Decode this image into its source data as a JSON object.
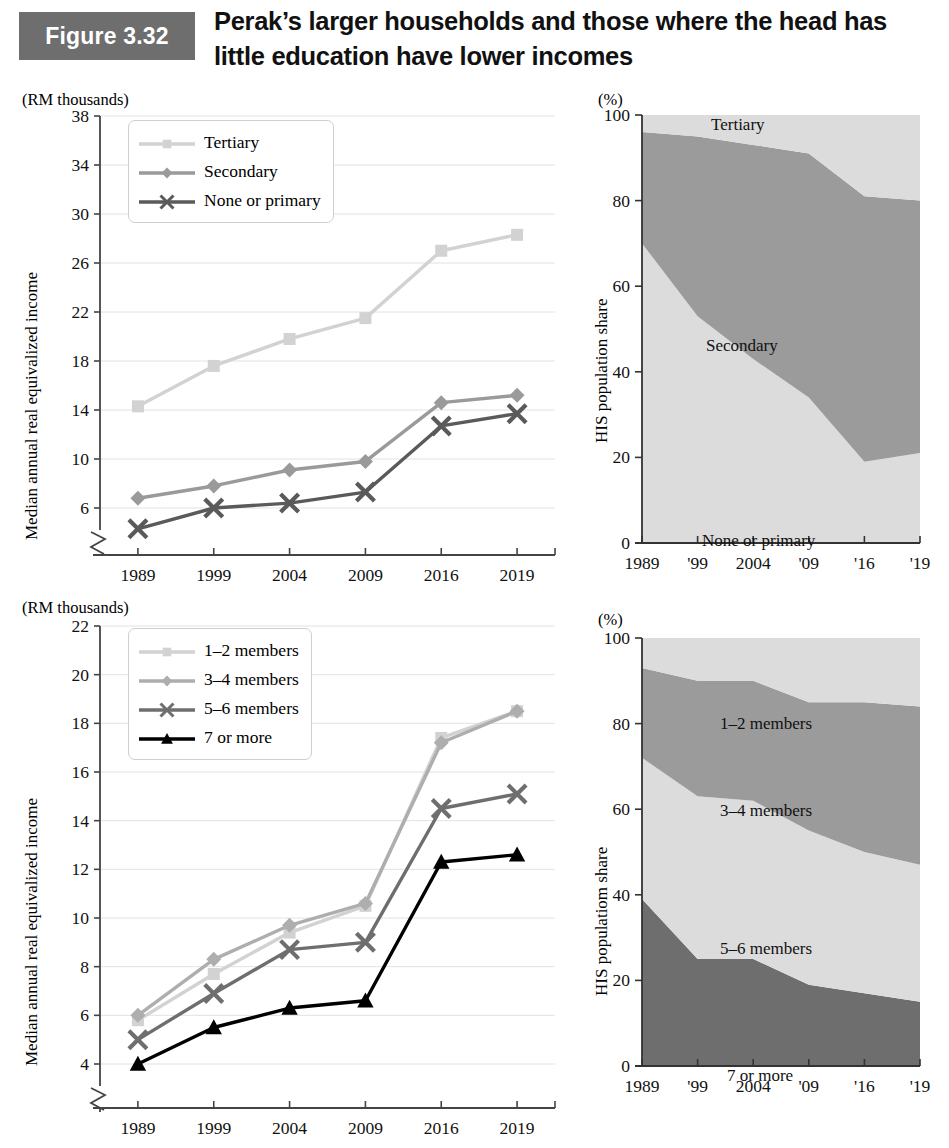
{
  "header": {
    "figure_badge": "Figure 3.32",
    "title_line1": "Perak’s larger households and those where the head has",
    "title_line2": "little education have lower incomes",
    "badge_color": "#6e6e6e"
  },
  "colors": {
    "tertiary": "#d2d2d2",
    "secondary": "#9a9a9a",
    "none_or_primary": "#5a5a5a",
    "m12": "#d2d2d2",
    "m34": "#aeaeae",
    "m56": "#6e6e6e",
    "m7plus": "#000000",
    "area_light": "#dcdcdc",
    "area_mid": "#9b9b9b",
    "area_dark": "#6e6e6e",
    "gridline": "#e2e2e2",
    "axis": "#555555"
  },
  "panels": {
    "top_left": {
      "unit_label": "(RM thousands)",
      "y_axis_title": "Median annual real equivalized income",
      "legend": [
        "Tertiary",
        "Secondary",
        "None or primary"
      ]
    },
    "top_right": {
      "unit_label": "(%)",
      "y_axis_title": "HIS population share",
      "area_labels": [
        "Tertiary",
        "Secondary",
        "None or primary"
      ]
    },
    "bottom_left": {
      "unit_label": "(RM thousands)",
      "y_axis_title": "Median annual real equivalized income",
      "legend": [
        "1–2 members",
        "3–4 members",
        "5–6 members",
        "7 or more"
      ]
    },
    "bottom_right": {
      "unit_label": "(%)",
      "y_axis_title": "HIS populatiom share",
      "area_labels": [
        "1–2 members",
        "3–4 members",
        "5–6 members",
        "7 or more"
      ]
    }
  },
  "chart_data": [
    {
      "id": "top_left",
      "type": "line",
      "title": "Median real equivalized income by education of household head",
      "xlabel": "",
      "ylabel": "Median annual real equivalized income",
      "unit": "(RM thousands)",
      "categories": [
        "1989",
        "1999",
        "2004",
        "2009",
        "2016",
        "2019"
      ],
      "yticks": [
        6,
        10,
        14,
        18,
        22,
        26,
        30,
        34,
        38
      ],
      "ylim": [
        4.2,
        38
      ],
      "axis_break": true,
      "grid": true,
      "legend_position": "top-left-inside",
      "series": [
        {
          "name": "Tertiary",
          "marker": "square",
          "color": "#d2d2d2",
          "values": [
            14.3,
            17.6,
            19.8,
            21.5,
            27.0,
            28.3
          ]
        },
        {
          "name": "Secondary",
          "marker": "diamond",
          "color": "#9a9a9a",
          "values": [
            6.8,
            7.8,
            9.1,
            9.8,
            14.6,
            15.2
          ]
        },
        {
          "name": "None or primary",
          "marker": "cross",
          "color": "#5a5a5a",
          "values": [
            4.3,
            6.0,
            6.4,
            7.3,
            12.7,
            13.7
          ]
        }
      ]
    },
    {
      "id": "top_right",
      "type": "area",
      "title": "HIS population share by education of household head",
      "xlabel": "",
      "ylabel": "HIS population share",
      "unit": "(%)",
      "x": [
        "1989",
        "'99",
        "2004",
        "'09",
        "'16",
        "'19"
      ],
      "yticks": [
        0,
        20,
        40,
        60,
        80,
        100
      ],
      "ylim": [
        0,
        100
      ],
      "stacked": true,
      "grid": false,
      "series": [
        {
          "name": "None or primary",
          "color": "#dcdcdc",
          "values": [
            70,
            53,
            43,
            34,
            19,
            21
          ]
        },
        {
          "name": "Secondary",
          "color": "#9b9b9b",
          "values": [
            26,
            42,
            50,
            57,
            62,
            59
          ]
        },
        {
          "name": "Tertiary",
          "color": "#dcdcdc",
          "values": [
            4,
            5,
            7,
            9,
            19,
            20
          ]
        }
      ]
    },
    {
      "id": "bottom_left",
      "type": "line",
      "title": "Median real equivalized income by household size",
      "xlabel": "",
      "ylabel": "Median annual real equivalized income",
      "unit": "(RM thousands)",
      "categories": [
        "1989",
        "1999",
        "2004",
        "2009",
        "2016",
        "2019"
      ],
      "yticks": [
        4,
        6,
        8,
        10,
        12,
        14,
        16,
        18,
        20,
        22
      ],
      "ylim": [
        3.2,
        22
      ],
      "axis_break": true,
      "grid": true,
      "legend_position": "top-left-inside",
      "series": [
        {
          "name": "1–2 members",
          "marker": "square",
          "color": "#d2d2d2",
          "values": [
            5.8,
            7.7,
            9.4,
            10.5,
            17.4,
            18.5
          ]
        },
        {
          "name": "3–4 members",
          "marker": "diamond",
          "color": "#aeaeae",
          "values": [
            6.0,
            8.3,
            9.7,
            10.6,
            17.2,
            18.5
          ]
        },
        {
          "name": "5–6 members",
          "marker": "cross",
          "color": "#6e6e6e",
          "values": [
            5.0,
            6.9,
            8.7,
            9.0,
            14.5,
            15.1
          ]
        },
        {
          "name": "7 or more",
          "marker": "triangle",
          "color": "#000000",
          "values": [
            4.0,
            5.5,
            6.3,
            6.6,
            12.3,
            12.6
          ]
        }
      ]
    },
    {
      "id": "bottom_right",
      "type": "area",
      "title": "HIS population share by household size",
      "xlabel": "",
      "ylabel": "HIS populatiom share",
      "unit": "(%)",
      "x": [
        "1989",
        "'99",
        "2004",
        "'09",
        "'16",
        "'19"
      ],
      "yticks": [
        0,
        20,
        40,
        60,
        80,
        100
      ],
      "ylim": [
        0,
        100
      ],
      "stacked": true,
      "grid": false,
      "series": [
        {
          "name": "7 or more",
          "color": "#6e6e6e",
          "values": [
            39,
            25,
            25,
            19,
            17,
            15
          ]
        },
        {
          "name": "5–6 members",
          "color": "#dcdcdc",
          "values": [
            33,
            38,
            37,
            36,
            33,
            32
          ]
        },
        {
          "name": "3–4 members",
          "color": "#9b9b9b",
          "values": [
            21,
            27,
            28,
            30,
            35,
            37
          ]
        },
        {
          "name": "1–2 members",
          "color": "#dcdcdc",
          "values": [
            7,
            10,
            10,
            15,
            15,
            16
          ]
        }
      ]
    }
  ]
}
